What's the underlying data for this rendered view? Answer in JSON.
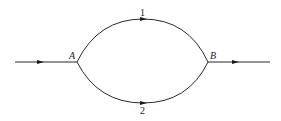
{
  "diagram": {
    "type": "parallel-path network",
    "nodes": [
      {
        "id": "A",
        "label": "A",
        "x": 77,
        "y": 62
      },
      {
        "id": "B",
        "label": "B",
        "x": 208,
        "y": 62
      }
    ],
    "branches": [
      {
        "id": "1",
        "label": "1",
        "from": "A",
        "to": "B",
        "position": "upper"
      },
      {
        "id": "2",
        "label": "2",
        "from": "A",
        "to": "B",
        "position": "lower"
      }
    ],
    "inflow": {
      "to": "A",
      "direction": "left-to-right"
    },
    "outflow": {
      "from": "B",
      "direction": "left-to-right"
    },
    "colors": {
      "line": "#2a2a2a",
      "background": "#ffffff"
    }
  }
}
